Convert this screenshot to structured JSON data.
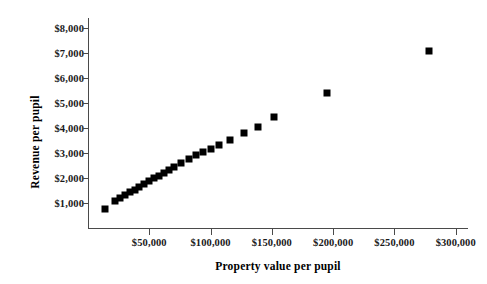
{
  "chart_data": {
    "type": "scatter",
    "title": "",
    "xlabel": "Property value per pupil",
    "ylabel": "Revenue per pupil",
    "xlim": [
      0,
      310000
    ],
    "ylim": [
      0,
      8400
    ],
    "grid": false,
    "legend": false,
    "marker": "filled-square",
    "marker_color": "#000000",
    "x_ticks": [
      {
        "value": 50000,
        "label": "$50,000"
      },
      {
        "value": 100000,
        "label": "$100,000"
      },
      {
        "value": 150000,
        "label": "$150,000"
      },
      {
        "value": 200000,
        "label": "$200,000"
      },
      {
        "value": 250000,
        "label": "$250,000"
      },
      {
        "value": 300000,
        "label": "$300,000"
      }
    ],
    "y_ticks": [
      {
        "value": 1000,
        "label": "$1,000"
      },
      {
        "value": 2000,
        "label": "$2,000"
      },
      {
        "value": 3000,
        "label": "$3,000"
      },
      {
        "value": 4000,
        "label": "$4,000"
      },
      {
        "value": 5000,
        "label": "$5,000"
      },
      {
        "value": 6000,
        "label": "$6,000"
      },
      {
        "value": 7000,
        "label": "$7,000"
      },
      {
        "value": 8000,
        "label": "$8,000"
      }
    ],
    "points": [
      {
        "x": 14000,
        "y": 780
      },
      {
        "x": 22000,
        "y": 1080
      },
      {
        "x": 26000,
        "y": 1200
      },
      {
        "x": 30000,
        "y": 1310
      },
      {
        "x": 34000,
        "y": 1430
      },
      {
        "x": 38000,
        "y": 1540
      },
      {
        "x": 42000,
        "y": 1650
      },
      {
        "x": 46000,
        "y": 1760
      },
      {
        "x": 50000,
        "y": 1880
      },
      {
        "x": 54000,
        "y": 1990
      },
      {
        "x": 58000,
        "y": 2100
      },
      {
        "x": 62000,
        "y": 2210
      },
      {
        "x": 66000,
        "y": 2330
      },
      {
        "x": 70000,
        "y": 2440
      },
      {
        "x": 76000,
        "y": 2620
      },
      {
        "x": 82000,
        "y": 2780
      },
      {
        "x": 88000,
        "y": 2920
      },
      {
        "x": 94000,
        "y": 3050
      },
      {
        "x": 100000,
        "y": 3180
      },
      {
        "x": 107000,
        "y": 3330
      },
      {
        "x": 116000,
        "y": 3520
      },
      {
        "x": 127000,
        "y": 3790
      },
      {
        "x": 139000,
        "y": 4060
      },
      {
        "x": 152000,
        "y": 4450
      },
      {
        "x": 195000,
        "y": 5400
      },
      {
        "x": 278000,
        "y": 7100
      }
    ]
  }
}
